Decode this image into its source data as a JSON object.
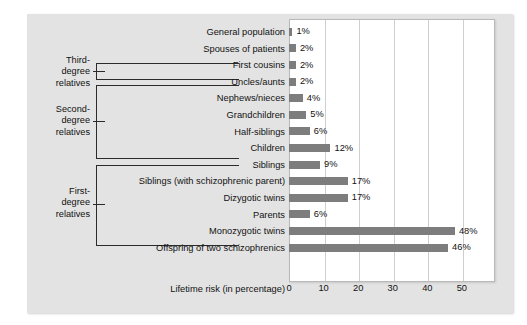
{
  "chart_data": {
    "type": "bar",
    "orientation": "horizontal",
    "title": "",
    "xlabel": "Lifetime risk (in percentage)",
    "ylabel": "",
    "xlim": [
      0,
      59
    ],
    "grid": true,
    "legend": null,
    "xticks": [
      0,
      10,
      20,
      30,
      40,
      50
    ],
    "categories": [
      "General population",
      "Spouses of patients",
      "First cousins",
      "Uncles/aunts",
      "Nephews/nieces",
      "Grandchildren",
      "Half-siblings",
      "Children",
      "Siblings",
      "Siblings (with schizophrenic parent)",
      "Dizygotic twins",
      "Parents",
      "Monozygotic twins",
      "Offspring of two schizophrenics"
    ],
    "values": [
      1,
      2,
      2,
      2,
      4,
      5,
      6,
      12,
      9,
      17,
      17,
      6,
      48,
      46
    ],
    "value_labels": [
      "1%",
      "2%",
      "2%",
      "2%",
      "4%",
      "5%",
      "6%",
      "12%",
      "9%",
      "17%",
      "17%",
      "6%",
      "48%",
      "46%"
    ],
    "bar_color": "#7d7d7d",
    "annotations": [
      {
        "label": "Third-\ndegree\nrelatives",
        "covers": [
          "First cousins"
        ]
      },
      {
        "label": "Second-\ndegree\nrelatives",
        "covers": [
          "Uncles/aunts",
          "Nephews/nieces",
          "Grandchildren",
          "Half-siblings"
        ]
      },
      {
        "label": "First-\ndegree\nrelatives",
        "covers": [
          "Children",
          "Siblings",
          "Siblings (with schizophrenic parent)",
          "Dizygotic twins",
          "Parents"
        ]
      }
    ]
  },
  "groups": [
    {
      "name": "third-degree",
      "label": "Third-\ndegree\nrelatives"
    },
    {
      "name": "second-degree",
      "label": "Second-\ndegree\nrelatives"
    },
    {
      "name": "first-degree",
      "label": "First-\ndegree\nrelatives"
    }
  ],
  "axis": {
    "title": "Lifetime risk (in percentage)",
    "ticks": [
      "0",
      "10",
      "20",
      "30",
      "40",
      "50"
    ]
  },
  "colors": {
    "panel_background": "#e3e3e3",
    "plot_background": "#ffffff",
    "bar": "#7d7d7d",
    "gridline": "#cfcfcf",
    "text": "#121212",
    "bracket": "#2b2b2b"
  }
}
